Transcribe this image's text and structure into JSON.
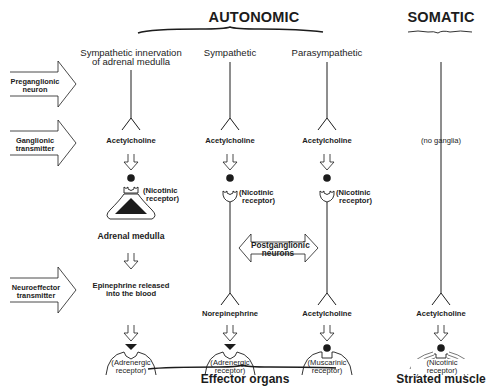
{
  "titles": {
    "autonomic": "AUTONOMIC",
    "somatic": "SOMATIC"
  },
  "columns": [
    {
      "id": "adrenal",
      "heading_line1": "Sympathetic innervation",
      "heading_line2": "of adrenal medulla"
    },
    {
      "id": "sympathetic",
      "heading_line1": "Sympathetic",
      "heading_line2": ""
    },
    {
      "id": "parasympathetic",
      "heading_line1": "Parasympathetic",
      "heading_line2": ""
    },
    {
      "id": "somatic",
      "heading_line1": "",
      "heading_line2": ""
    }
  ],
  "row_labels": {
    "preganglionic": {
      "line1": "Preganglionic",
      "line2": "neuron"
    },
    "ganglionic": {
      "line1": "Ganglionic",
      "line2": "transmitter"
    },
    "neuroeffector": {
      "line1": "Neuroeffector",
      "line2": "transmitter"
    }
  },
  "ganglionic_transmitters": {
    "adrenal": "Acetylcholine",
    "sympathetic": "Acetylcholine",
    "parasympathetic": "Acetylcholine",
    "somatic": "(no ganglia)"
  },
  "ganglion_receptors": {
    "adrenal": {
      "line1": "(Nicotinic",
      "line2": "receptor)"
    },
    "sympathetic": {
      "line1": "(Nicotinic",
      "line2": "receptor)"
    },
    "parasympathetic": {
      "line1": "(Nicotinic",
      "line2": "receptor)"
    }
  },
  "adrenal_medulla_label": "Adrenal medulla",
  "postganglionic_label": {
    "line1": "Postganglionic",
    "line2": "neurons"
  },
  "neuroeffector_transmitters": {
    "adrenal": {
      "line1": "Epinephrine released",
      "line2": "into the blood"
    },
    "sympathetic": "Norepinephrine",
    "parasympathetic": "Acetylcholine",
    "somatic": "Acetylcholine"
  },
  "effector_receptors": {
    "adrenal": {
      "line1": "(Adrenergic",
      "line2": "receptor)"
    },
    "sympathetic": {
      "line1": "(Adrenergic",
      "line2": "receptor)"
    },
    "parasympathetic": {
      "line1": "(Muscarinic",
      "line2": "receptor)"
    },
    "somatic": {
      "line1": "(Nicotinic",
      "line2": "receptor)"
    }
  },
  "bottom_labels": {
    "effector_organs": "Effector organs",
    "striated_muscle": "Striated muscle"
  },
  "colors": {
    "ink": "#1c1c1c",
    "background": "#ffffff"
  }
}
